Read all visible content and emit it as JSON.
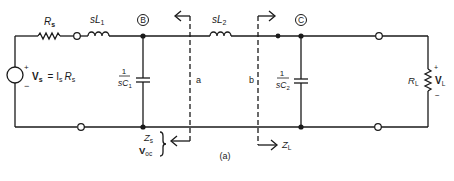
{
  "figure": {
    "caption": "(a)",
    "source": {
      "symbol": "V",
      "subscript": "s",
      "equation_rhs": "= I",
      "equation_rhs_sub": "s",
      "equation_rhs_r": "R",
      "equation_rhs_r_sub": "s",
      "plus": "+",
      "minus": "−"
    },
    "components": {
      "rs": {
        "main": "R",
        "sub": "s"
      },
      "sl1": {
        "pre": "s",
        "main": "L",
        "sub": "1"
      },
      "sl2": {
        "pre": "s",
        "main": "L",
        "sub": "2"
      },
      "c1": {
        "num": "1",
        "den_pre": "s",
        "den_main": "C",
        "den_sub": "1"
      },
      "c2": {
        "num": "1",
        "den_pre": "s",
        "den_main": "C",
        "den_sub": "2"
      },
      "rl": {
        "main": "R",
        "sub": "L"
      },
      "vl": {
        "main": "V",
        "sub": "L",
        "plus": "+",
        "minus": "−"
      }
    },
    "nodes": {
      "b": "B",
      "c": "C"
    },
    "planes": {
      "a": "a",
      "b": "b"
    },
    "impedances": {
      "zs": {
        "main": "Z",
        "sub": "s"
      },
      "voc": {
        "main": "V",
        "sub": "oc"
      },
      "zl": {
        "main": "Z",
        "sub": "L"
      }
    }
  }
}
